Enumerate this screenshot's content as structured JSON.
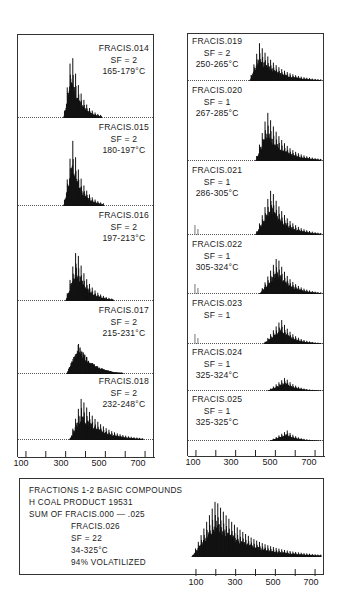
{
  "chart_data": {
    "type": "bar",
    "xlabel": "m/z",
    "ylabel": "relative intensity",
    "xlim": [
      60,
      750
    ],
    "x_ticks": [
      100,
      200,
      300,
      400,
      500,
      600,
      700
    ],
    "x_tick_labels": [
      "100",
      "300",
      "500",
      "700"
    ],
    "grid": false,
    "panels": [
      {
        "id": "FRACIS.014",
        "sf": "SF = 2",
        "temp": "165-179°C",
        "column": "left",
        "start": 290,
        "peak": 330,
        "end": 480,
        "height": 1.0
      },
      {
        "id": "FRACIS.015",
        "sf": "SF = 2",
        "temp": "180-197°C",
        "column": "left",
        "start": 290,
        "peak": 335,
        "end": 490,
        "height": 0.95
      },
      {
        "id": "FRACIS.016",
        "sf": "SF = 2",
        "temp": "197-213°C",
        "column": "left",
        "start": 300,
        "peak": 355,
        "end": 540,
        "height": 0.85
      },
      {
        "id": "FRACIS.017",
        "sf": "SF = 2",
        "temp": "215-231°C",
        "column": "left",
        "start": 305,
        "peak": 365,
        "end": 590,
        "height": 0.85
      },
      {
        "id": "FRACIS.018",
        "sf": "SF = 2",
        "temp": "232-248°C",
        "column": "left",
        "start": 320,
        "peak": 380,
        "end": 690,
        "height": 0.85
      },
      {
        "id": "FRACIS.019",
        "sf": "SF = 2",
        "temp": "250-265°C",
        "column": "right",
        "start": 370,
        "peak": 420,
        "end": 730,
        "height": 0.9
      },
      {
        "id": "FRACIS.020",
        "sf": "SF = 1",
        "temp": "267-285°C",
        "column": "right",
        "start": 400,
        "peak": 460,
        "end": 730,
        "height": 0.85
      },
      {
        "id": "FRACIS.021",
        "sf": "SF = 1",
        "temp": "286-305°C",
        "column": "right",
        "start": 400,
        "peak": 480,
        "end": 730,
        "height": 0.75
      },
      {
        "id": "FRACIS.022",
        "sf": "SF = 1",
        "temp": "305-324°C",
        "column": "right",
        "start": 420,
        "peak": 510,
        "end": 730,
        "height": 0.75
      },
      {
        "id": "FRACIS.023",
        "sf": "SF = 1",
        "temp": "",
        "column": "right",
        "start": 440,
        "peak": 530,
        "end": 730,
        "height": 0.65
      },
      {
        "id": "FRACIS.024",
        "sf": "SF = 1",
        "temp": "325-324°C",
        "column": "right",
        "start": 460,
        "peak": 550,
        "end": 730,
        "height": 0.45
      },
      {
        "id": "FRACIS.025",
        "sf": "SF = 1",
        "temp": "325-325°C",
        "column": "right",
        "start": 470,
        "peak": 560,
        "end": 730,
        "height": 0.35
      }
    ],
    "summary": {
      "id": "FRACIS.026",
      "sf": "SF = 22",
      "temp": "34-325°C",
      "volatilized": "94% VOLATILIZED",
      "start": 80,
      "peak": 200,
      "end": 730,
      "height": 0.95
    }
  },
  "left_column": {
    "panels": [
      {
        "id": "FRACIS.014",
        "sf": "SF = 2",
        "temp": "165-179°C"
      },
      {
        "id": "FRACIS.015",
        "sf": "SF = 2",
        "temp": "180-197°C"
      },
      {
        "id": "FRACIS.016",
        "sf": "SF = 2",
        "temp": "197-213°C"
      },
      {
        "id": "FRACIS.017",
        "sf": "SF = 2",
        "temp": "215-231°C"
      },
      {
        "id": "FRACIS.018",
        "sf": "SF = 2",
        "temp": "232-248°C"
      }
    ],
    "tick_labels": [
      "100",
      "300",
      "500",
      "700"
    ]
  },
  "right_column": {
    "panels": [
      {
        "id": "FRACIS.019",
        "sf": "SF = 2",
        "temp": "250-265°C"
      },
      {
        "id": "FRACIS.020",
        "sf": "SF = 1",
        "temp": "267-285°C"
      },
      {
        "id": "FRACIS.021",
        "sf": "SF = 1",
        "temp": "286-305°C"
      },
      {
        "id": "FRACIS.022",
        "sf": "SF = 1",
        "temp": "305-324°C"
      },
      {
        "id": "FRACIS.023",
        "sf": "SF = 1",
        "temp": ""
      },
      {
        "id": "FRACIS.024",
        "sf": "SF = 1",
        "temp": "325-324°C"
      },
      {
        "id": "FRACIS.025",
        "sf": "SF = 1",
        "temp": "325-325°C"
      }
    ],
    "tick_labels": [
      "100",
      "300",
      "500",
      "700"
    ]
  },
  "summary_box": {
    "line1": "FRACTIONS 1-2 BASIC COMPOUNDS",
    "line2": "H COAL PRODUCT 19531",
    "line3": "SUM OF FRACIS.000 — .025",
    "line4": "FRACIS.026",
    "line5": "SF = 22",
    "line6": "34-325°C",
    "line7": "94% VOLATILIZED",
    "tick_labels": [
      "100",
      "300",
      "500",
      "700"
    ]
  }
}
